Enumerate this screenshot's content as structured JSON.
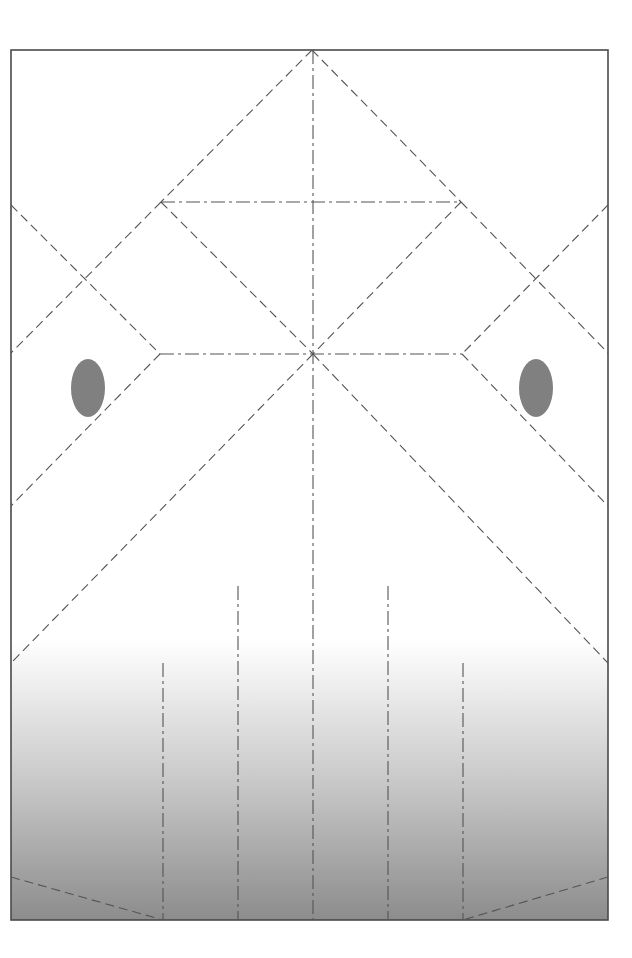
{
  "figure": {
    "title": "",
    "type": "technical-line-diagram",
    "canvas": {
      "width": 632,
      "height": 958
    },
    "background_color": "#ffffff"
  },
  "frame": {
    "name": "outer-frame",
    "x": 11,
    "y": 50,
    "width": 597,
    "height": 870,
    "stroke_color": "#4a4a4a",
    "stroke_width": 1.6,
    "fill": "none"
  },
  "ground_gradient": {
    "name": "ground-gradient-fill",
    "x": 11,
    "y": 640,
    "width": 597,
    "height": 280,
    "top_color": "#ffffff",
    "mid_color": "#c9c9c9",
    "bottom_color": "#8c8c8c"
  },
  "style": {
    "dash_color": "#555555",
    "dash_stroke_width": 1.1,
    "dash_pattern_long": "9 5",
    "dash_pattern_dashdot": "14 4 3 4",
    "dash_pattern_fine": "6 4",
    "oval_fill": "#808080"
  },
  "key_points": {
    "apex_top": {
      "x": 312,
      "y": 50
    },
    "center": {
      "x": 313,
      "y": 354
    },
    "upper_left_node": {
      "x": 161,
      "y": 202
    },
    "upper_right_node": {
      "x": 461,
      "y": 202
    },
    "mid_left_node": {
      "x": 160,
      "y": 354
    },
    "mid_right_node": {
      "x": 462,
      "y": 354
    },
    "left_cross": {
      "x": 86,
      "y": 278
    },
    "right_cross": {
      "x": 536,
      "y": 278
    },
    "bottom_left_kink": {
      "x": 163,
      "y": 920
    },
    "bottom_right_kink": {
      "x": 463,
      "y": 920
    }
  },
  "elements": {
    "verticals": [
      {
        "name": "vertical-guide-1",
        "x": 163,
        "y1": 663,
        "y2": 920
      },
      {
        "name": "vertical-guide-2",
        "x": 238,
        "y1": 586,
        "y2": 920
      },
      {
        "name": "vertical-centerline",
        "x": 313,
        "y1": 50,
        "y2": 920
      },
      {
        "name": "vertical-guide-4",
        "x": 388,
        "y1": 586,
        "y2": 920
      },
      {
        "name": "vertical-guide-5",
        "x": 463,
        "y1": 663,
        "y2": 920
      }
    ],
    "horizontals": [
      {
        "name": "upper-horizontal-chord",
        "y": 202,
        "x1": 161,
        "x2": 461
      },
      {
        "name": "mid-horizontal-chord",
        "y": 354,
        "x1": 160,
        "x2": 462
      }
    ],
    "ovals": [
      {
        "name": "left-oval-marker",
        "cx": 88,
        "cy": 388,
        "rx": 17,
        "ry": 29
      },
      {
        "name": "right-oval-marker",
        "cx": 536,
        "cy": 388,
        "rx": 17,
        "ry": 29
      }
    ],
    "diagonals": [
      {
        "name": "apex-to-upper-left",
        "x1": 312,
        "y1": 50,
        "x2": 161,
        "y2": 202
      },
      {
        "name": "apex-to-upper-right",
        "x1": 312,
        "y1": 50,
        "x2": 461,
        "y2": 202
      },
      {
        "name": "upper-left-to-center",
        "x1": 161,
        "y1": 202,
        "x2": 313,
        "y2": 354
      },
      {
        "name": "upper-right-to-center",
        "x1": 461,
        "y1": 202,
        "x2": 313,
        "y2": 354
      },
      {
        "name": "upper-left-to-left-edge",
        "x1": 161,
        "y1": 202,
        "x2": 11,
        "y2": 353
      },
      {
        "name": "upper-right-to-right-edge",
        "x1": 461,
        "y1": 202,
        "x2": 608,
        "y2": 353
      },
      {
        "name": "left-edge-to-mid-left",
        "x1": 11,
        "y1": 205,
        "x2": 160,
        "y2": 354
      },
      {
        "name": "right-edge-to-mid-right",
        "x1": 608,
        "y1": 205,
        "x2": 462,
        "y2": 354
      },
      {
        "name": "mid-left-to-left-edge-lower",
        "x1": 160,
        "y1": 354,
        "x2": 11,
        "y2": 506
      },
      {
        "name": "mid-right-to-right-edge-lower",
        "x1": 462,
        "y1": 354,
        "x2": 608,
        "y2": 506
      },
      {
        "name": "center-to-bottom-left-edge",
        "x1": 313,
        "y1": 354,
        "x2": 11,
        "y2": 663
      },
      {
        "name": "center-to-bottom-right-edge",
        "x1": 313,
        "y1": 354,
        "x2": 608,
        "y2": 663
      },
      {
        "name": "ground-left-bevel",
        "x1": 11,
        "y1": 877,
        "x2": 163,
        "y2": 920
      },
      {
        "name": "ground-right-bevel",
        "x1": 608,
        "y1": 877,
        "x2": 463,
        "y2": 920
      }
    ]
  }
}
